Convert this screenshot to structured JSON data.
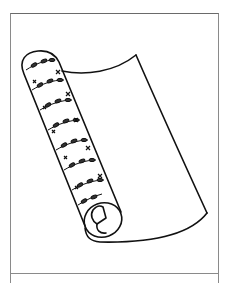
{
  "illustration": {
    "subject": "rolled wallpaper sheet with leafy vine pattern",
    "colors": {
      "stroke": "#111111",
      "frame": "#8a8a8a",
      "background": "#ffffff"
    }
  }
}
